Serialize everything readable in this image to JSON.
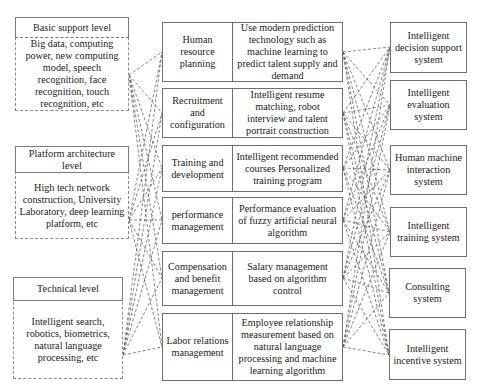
{
  "left_levels": [
    {
      "title": "Basic support level",
      "body": "Big data, computing power, new computing model, speech recognition, face recognition, touch recognition, etc"
    },
    {
      "title": "Platform architecture level",
      "body": "High tech network construction, University Laboratory, deep learning platform, etc"
    },
    {
      "title": "Technical level",
      "body": "Intelligent search, robotics, biometrics, natural language processing, etc"
    }
  ],
  "hr_modules": [
    {
      "name": "Human resource planning",
      "description": "Use modern prediction technology such as machine learning to predict talent supply and demand"
    },
    {
      "name": "Recruitment and configuration",
      "description": "Intelligent resume matching, robot interview and talent portrait construction"
    },
    {
      "name": "Training and development",
      "description": "Intelligent recommended courses Personalized training program"
    },
    {
      "name": "performance management",
      "description": "Performance evaluation of fuzzy artificial neural algorithm"
    },
    {
      "name": "Compensation and benefit management",
      "description": "Salary management based on algorithm control"
    },
    {
      "name": "Labor relations management",
      "description": "Employee relationship measurement based on natural language processing and machine learning algorithm"
    }
  ],
  "systems": [
    {
      "name": "Intelligent decision support system"
    },
    {
      "name": "Intelligent evaluation system"
    },
    {
      "name": "Human machine interaction system"
    },
    {
      "name": "Intelligent training system"
    },
    {
      "name": "Consulting system"
    },
    {
      "name": "Intelligent incentive system"
    }
  ],
  "connections": {
    "left_to_modules": "all-to-all (dashed)",
    "modules_to_systems": "all-to-all (dashed)"
  }
}
